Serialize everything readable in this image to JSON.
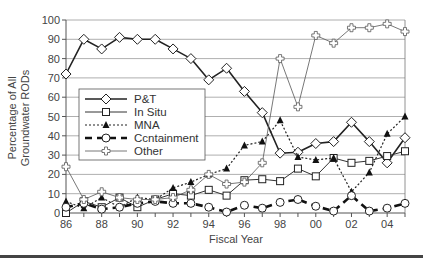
{
  "chart_data": {
    "type": "line",
    "title": "",
    "xlabel": "Fiscal Year",
    "ylabel_lines": [
      "Percentage of All",
      "Groundwater RODs"
    ],
    "ylim": [
      0,
      100
    ],
    "yticks": [
      "0",
      "10",
      "20",
      "30",
      "40",
      "50",
      "60",
      "70",
      "80",
      "90",
      "100"
    ],
    "x": [
      "86",
      "87",
      "88",
      "89",
      "90",
      "91",
      "92",
      "93",
      "94",
      "95",
      "96",
      "97",
      "98",
      "99",
      "00",
      "01",
      "02",
      "03",
      "04",
      "05"
    ],
    "xtick_labels": [
      "86",
      "88",
      "90",
      "92",
      "94",
      "96",
      "98",
      "00",
      "02",
      "04"
    ],
    "grid": "horizontal",
    "legend_position": "inside-left-middle",
    "series": [
      {
        "name": "P&T",
        "marker": "diamond",
        "line": "solid-thick",
        "values": [
          72,
          90,
          85,
          91,
          90,
          90,
          85,
          80,
          69,
          75,
          63,
          52,
          31,
          31.5,
          36,
          37,
          47,
          37,
          26,
          39
        ]
      },
      {
        "name": "In Situ",
        "marker": "square",
        "line": "solid",
        "values": [
          0,
          6,
          3,
          8,
          3,
          7,
          10,
          9,
          12,
          9,
          17,
          17.5,
          16.5,
          23,
          19,
          28.5,
          26,
          27,
          29.5,
          32
        ]
      },
      {
        "name": "MNA",
        "marker": "triangle",
        "line": "dotted",
        "values": [
          6,
          2.5,
          8,
          3,
          8,
          7,
          13,
          16,
          20,
          23,
          35,
          37,
          48,
          29,
          27.5,
          28.5,
          11,
          21,
          41,
          50
        ]
      },
      {
        "name": "Ccntainment",
        "marker": "circle",
        "line": "dashed-thick",
        "values": [
          3,
          5,
          2,
          3,
          5,
          6,
          5,
          5,
          3,
          0.5,
          4,
          2.5,
          5.5,
          7,
          3.5,
          1,
          9,
          1,
          2.5,
          5
        ]
      },
      {
        "name": "Other",
        "marker": "cross",
        "line": "thin",
        "values": [
          24,
          7,
          11,
          8,
          7,
          7,
          8,
          12,
          20,
          15,
          16,
          26,
          80,
          55,
          92,
          88,
          96,
          96,
          98,
          94
        ]
      }
    ]
  },
  "legend": {
    "items": [
      "P&T",
      "In Situ",
      "MNA",
      "Ccntainment",
      "Other"
    ]
  }
}
